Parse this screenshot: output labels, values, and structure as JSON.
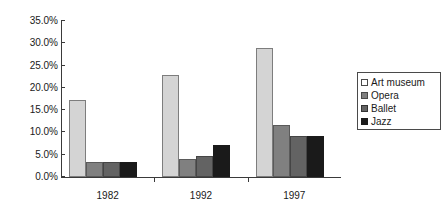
{
  "chart_data": {
    "type": "bar",
    "title": "",
    "subtitle": "",
    "xlabel": "",
    "ylabel": "",
    "categories": [
      "1982",
      "1992",
      "1997"
    ],
    "series": [
      {
        "name": "Art museum",
        "color": "#d4d4d4",
        "values": [
          17.2,
          22.9,
          28.9
        ]
      },
      {
        "name": "Opera",
        "color": "#808080",
        "values": [
          3.4,
          4.0,
          11.6
        ]
      },
      {
        "name": "Ballet",
        "color": "#636363",
        "values": [
          3.3,
          4.7,
          9.1
        ]
      },
      {
        "name": "Jazz",
        "color": "#1a1a1a",
        "values": [
          3.4,
          7.2,
          9.1
        ]
      }
    ],
    "ylim": [
      0,
      35
    ],
    "ytick_labels": [
      "35.0%",
      "30.0%",
      "25.0%",
      "20.0%",
      "15.0%",
      "10.0%",
      "5.0%",
      "0.0%"
    ],
    "ytick_values": [
      35,
      30,
      25,
      20,
      15,
      10,
      5,
      0
    ],
    "grid": false,
    "legend_position": "right"
  },
  "legend": {
    "items": [
      {
        "label": "Art museum"
      },
      {
        "label": "Opera"
      },
      {
        "label": "Ballet"
      },
      {
        "label": "Jazz"
      }
    ]
  }
}
